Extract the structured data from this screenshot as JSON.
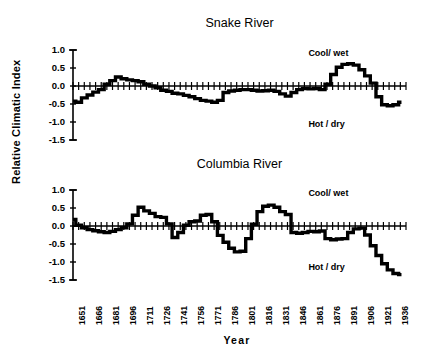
{
  "figure": {
    "ylabel": "Relative Climatic Index",
    "xlabel": "Year",
    "background": "#ffffff",
    "ink": "#000000"
  },
  "chart_data": [
    {
      "type": "line",
      "title": "Snake River",
      "xlabel": "",
      "ylabel": "Relative Climatic Index",
      "ylim": [
        -1.5,
        1.0
      ],
      "xlim": [
        1651,
        1945
      ],
      "yticks": [
        "1.0",
        "0.5",
        "0.0",
        "-0.5",
        "-1.0",
        "-1.5"
      ],
      "ytick_values": [
        1.0,
        0.5,
        0.0,
        -0.5,
        -1.0,
        -1.5
      ],
      "xticks": [
        "1651",
        "1666",
        "1681",
        "1696",
        "1711",
        "1726",
        "1741",
        "1756",
        "1771",
        "1786",
        "1801",
        "1816",
        "1831",
        "1846",
        "1861",
        "1876",
        "1891",
        "1906",
        "1921",
        "1936"
      ],
      "xtick_values": [
        1651,
        1666,
        1681,
        1696,
        1711,
        1726,
        1741,
        1756,
        1771,
        1786,
        1801,
        1816,
        1831,
        1846,
        1861,
        1876,
        1891,
        1906,
        1921,
        1936
      ],
      "grid": false,
      "legend": "none",
      "annotations": [
        {
          "text": "Cool/ wet",
          "x": 1880,
          "y": 0.88
        },
        {
          "text": "Hot / dry",
          "x": 1880,
          "y": -1.08
        }
      ],
      "x": [
        1651,
        1656,
        1661,
        1666,
        1671,
        1676,
        1681,
        1686,
        1691,
        1696,
        1701,
        1706,
        1711,
        1716,
        1721,
        1726,
        1731,
        1736,
        1741,
        1746,
        1751,
        1756,
        1761,
        1766,
        1771,
        1776,
        1781,
        1786,
        1791,
        1796,
        1801,
        1806,
        1811,
        1816,
        1821,
        1826,
        1831,
        1836,
        1841,
        1846,
        1851,
        1856,
        1861,
        1866,
        1871,
        1876,
        1881,
        1886,
        1891,
        1896,
        1901,
        1906,
        1911,
        1916,
        1921,
        1926,
        1931,
        1936,
        1941
      ],
      "values": [
        -0.42,
        -0.45,
        -0.33,
        -0.25,
        -0.17,
        -0.1,
        0.05,
        0.15,
        0.25,
        0.2,
        0.17,
        0.15,
        0.12,
        0.05,
        0.0,
        -0.05,
        -0.12,
        -0.15,
        -0.2,
        -0.22,
        -0.26,
        -0.3,
        -0.35,
        -0.4,
        -0.42,
        -0.45,
        -0.4,
        -0.18,
        -0.14,
        -0.12,
        -0.1,
        -0.1,
        -0.12,
        -0.14,
        -0.13,
        -0.12,
        -0.15,
        -0.22,
        -0.28,
        -0.18,
        -0.1,
        -0.07,
        -0.08,
        -0.07,
        -0.1,
        0.05,
        0.32,
        0.52,
        0.6,
        0.62,
        0.58,
        0.45,
        0.28,
        0.08,
        -0.3,
        -0.52,
        -0.55,
        -0.52,
        -0.45
      ]
    },
    {
      "type": "line",
      "title": "Columbia River",
      "xlabel": "Year",
      "ylabel": "Relative Climatic Index",
      "ylim": [
        -1.5,
        1.0
      ],
      "xlim": [
        1651,
        1945
      ],
      "yticks": [
        "1.0",
        "0.5",
        "0.0",
        "-0.5",
        "-1.0",
        "-1.5"
      ],
      "ytick_values": [
        1.0,
        0.5,
        0.0,
        -0.5,
        -1.0,
        -1.5
      ],
      "xticks": [
        "1651",
        "1666",
        "1681",
        "1696",
        "1711",
        "1726",
        "1741",
        "1756",
        "1771",
        "1786",
        "1801",
        "1816",
        "1831",
        "1846",
        "1861",
        "1876",
        "1891",
        "1906",
        "1921",
        "1936"
      ],
      "xtick_values": [
        1651,
        1666,
        1681,
        1696,
        1711,
        1726,
        1741,
        1756,
        1771,
        1786,
        1801,
        1816,
        1831,
        1846,
        1861,
        1876,
        1891,
        1906,
        1921,
        1936
      ],
      "grid": false,
      "legend": "none",
      "annotations": [
        {
          "text": "Cool/ wet",
          "x": 1880,
          "y": 0.88
        },
        {
          "text": "Hot / dry",
          "x": 1880,
          "y": -1.18
        }
      ],
      "x": [
        1651,
        1656,
        1661,
        1666,
        1671,
        1676,
        1681,
        1686,
        1691,
        1696,
        1701,
        1706,
        1711,
        1716,
        1721,
        1726,
        1731,
        1736,
        1741,
        1746,
        1751,
        1756,
        1761,
        1766,
        1771,
        1776,
        1781,
        1786,
        1791,
        1796,
        1801,
        1806,
        1811,
        1816,
        1821,
        1826,
        1831,
        1836,
        1841,
        1846,
        1851,
        1856,
        1861,
        1866,
        1871,
        1876,
        1881,
        1886,
        1891,
        1896,
        1901,
        1906,
        1911,
        1916,
        1921,
        1926,
        1931,
        1936,
        1941
      ],
      "values": [
        0.18,
        0.02,
        -0.05,
        -0.1,
        -0.13,
        -0.16,
        -0.18,
        -0.15,
        -0.1,
        -0.05,
        0.06,
        0.3,
        0.52,
        0.42,
        0.35,
        0.26,
        0.24,
        0.06,
        -0.32,
        -0.18,
        0.02,
        0.12,
        0.14,
        0.3,
        0.32,
        0.12,
        -0.26,
        -0.45,
        -0.62,
        -0.72,
        -0.7,
        -0.35,
        0.05,
        0.4,
        0.55,
        0.58,
        0.52,
        0.4,
        0.32,
        -0.18,
        -0.2,
        -0.18,
        -0.15,
        -0.16,
        -0.14,
        -0.35,
        -0.38,
        -0.36,
        -0.35,
        -0.18,
        -0.08,
        -0.06,
        -0.25,
        -0.55,
        -0.82,
        -1.05,
        -1.22,
        -1.32,
        -1.35
      ]
    }
  ]
}
